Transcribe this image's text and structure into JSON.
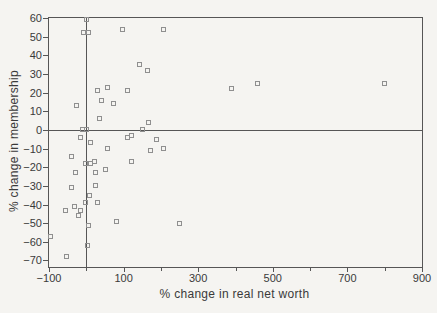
{
  "chart_data": {
    "type": "scatter",
    "title": "",
    "xlabel": "% change in real net worth",
    "ylabel": "% change in membership",
    "xlim": [
      -100,
      900
    ],
    "ylim": [
      -73.5,
      60
    ],
    "x_major_ticks": [
      -100,
      100,
      300,
      500,
      700,
      900
    ],
    "x_minor_ticks": [
      0,
      200,
      400,
      600,
      800
    ],
    "y_ticks": [
      60,
      50,
      40,
      30,
      20,
      10,
      0,
      -10,
      -20,
      -30,
      -40,
      -50,
      -60,
      -70
    ],
    "reference_lines": {
      "vertical_at_x": 0,
      "horizontal_at_y": 0
    },
    "marker": "open-square",
    "grid": "off",
    "legend": "none",
    "points": [
      [
        0,
        59
      ],
      [
        -7,
        52
      ],
      [
        6,
        52
      ],
      [
        96,
        54
      ],
      [
        206,
        54
      ],
      [
        142,
        35
      ],
      [
        164,
        32
      ],
      [
        390,
        22
      ],
      [
        460,
        25
      ],
      [
        800,
        25
      ],
      [
        29,
        21
      ],
      [
        56,
        23
      ],
      [
        111,
        21
      ],
      [
        42,
        16
      ],
      [
        73,
        14
      ],
      [
        -25,
        13
      ],
      [
        36,
        6
      ],
      [
        166,
        4
      ],
      [
        -11,
        0
      ],
      [
        1,
        0
      ],
      [
        150,
        0
      ],
      [
        -16,
        -4
      ],
      [
        12,
        -7
      ],
      [
        110,
        -4
      ],
      [
        120,
        -3
      ],
      [
        188,
        -5
      ],
      [
        56,
        -10
      ],
      [
        172,
        -11
      ],
      [
        208,
        -10
      ],
      [
        -40,
        -14
      ],
      [
        120,
        -17
      ],
      [
        -2,
        -18
      ],
      [
        10,
        -18
      ],
      [
        21,
        -17
      ],
      [
        -28,
        -23
      ],
      [
        24,
        -23
      ],
      [
        52,
        -21
      ],
      [
        25,
        -30
      ],
      [
        -40,
        -31
      ],
      [
        8,
        -35
      ],
      [
        -3,
        -39
      ],
      [
        31,
        -39
      ],
      [
        -31,
        -41
      ],
      [
        -57,
        -43
      ],
      [
        -15,
        -43
      ],
      [
        -21,
        -46
      ],
      [
        82,
        -49
      ],
      [
        6,
        -51
      ],
      [
        -95,
        -57
      ],
      [
        4,
        -62
      ],
      [
        -52,
        -68
      ],
      [
        250,
        -50
      ]
    ]
  },
  "colors": {
    "paper": "#f5f4f1",
    "axis": "#565656",
    "marker": "#8f8f8f",
    "text": "#3a3a3a"
  }
}
